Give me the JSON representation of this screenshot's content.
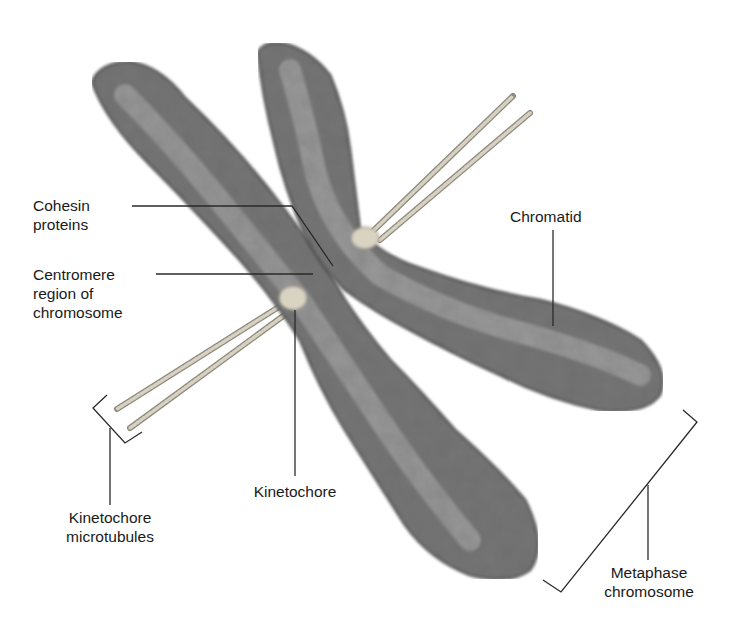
{
  "diagram": {
    "labels": {
      "cohesin": [
        "Cohesin",
        "proteins"
      ],
      "centromere": [
        "Centromere",
        "region of",
        "chromosome"
      ],
      "chromatid": [
        "Chromatid"
      ],
      "kinetochore": [
        "Kinetochore"
      ],
      "kinetochore_microtubules": [
        "Kinetochore",
        "microtubules"
      ],
      "metaphase_chromosome": [
        "Metaphase",
        "chromosome"
      ]
    },
    "colors": {
      "chromatid_dark": "#3a3a3a",
      "chromatid_mid": "#6b6b6b",
      "chromatid_light": "#b5b5b5",
      "microtubule": "#c9c4b4",
      "kinetochore": "#d9d3c2",
      "leader_line": "#2a2a2a",
      "background": "#ffffff"
    }
  }
}
